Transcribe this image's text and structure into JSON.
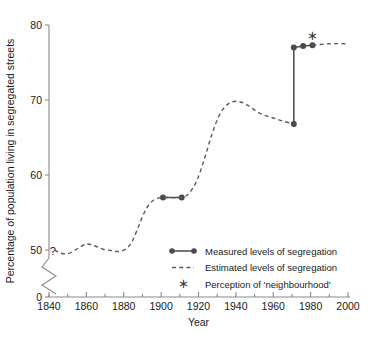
{
  "chart_data": {
    "type": "line",
    "title": "",
    "xlabel": "Year",
    "ylabel": "Percentage of population living in segregated streets",
    "xlim": [
      1840,
      2000
    ],
    "ylim": [
      45,
      80
    ],
    "grid": false,
    "axis_break": true,
    "axis_break_note": "y-axis broken between 0 and 50",
    "legend_position": "inside-lower-right",
    "x_ticks_major": [
      1840,
      1860,
      1880,
      1900,
      1920,
      1940,
      1960,
      1980,
      2000
    ],
    "x_tick_labels": [
      "1840",
      "1860",
      "1880",
      "1900",
      "1920",
      "1940",
      "1960",
      "1980",
      "2000"
    ],
    "x_ticks_minor": [
      1850,
      1870,
      1890,
      1910,
      1930,
      1950,
      1970,
      1990
    ],
    "y_ticks": [
      0,
      50,
      60,
      70,
      80
    ],
    "y_tick_labels": [
      "0",
      "50",
      "60",
      "70",
      "80"
    ],
    "annotations": [
      {
        "text": "?",
        "x": 1842,
        "y": 49.9,
        "note": "uncertainty before 1845"
      },
      {
        "text": "*",
        "x": 1981,
        "y": 78.6,
        "note": "perception of neighbourhood marker"
      }
    ],
    "series": [
      {
        "name": "Measured levels of segregation",
        "style": "solid-with-markers",
        "color": "#4a4a4a",
        "points": [
          {
            "x": 1901,
            "y": 57.0
          },
          {
            "x": 1911,
            "y": 57.0
          }
        ]
      },
      {
        "name": "Measured levels of segregation (late)",
        "style": "solid-with-markers",
        "color": "#4a4a4a",
        "points": [
          {
            "x": 1971,
            "y": 66.8
          },
          {
            "x": 1971,
            "y": 77.0
          },
          {
            "x": 1976,
            "y": 77.2
          },
          {
            "x": 1981,
            "y": 77.3
          }
        ]
      },
      {
        "name": "Estimated levels of segregation",
        "style": "dashed",
        "color": "#5a5a5a",
        "points": [
          {
            "x": 1843,
            "y": 50.0
          },
          {
            "x": 1846,
            "y": 49.6
          },
          {
            "x": 1850,
            "y": 49.5
          },
          {
            "x": 1854,
            "y": 50.0
          },
          {
            "x": 1858,
            "y": 50.6
          },
          {
            "x": 1861,
            "y": 50.8
          },
          {
            "x": 1865,
            "y": 50.5
          },
          {
            "x": 1869,
            "y": 50.1
          },
          {
            "x": 1874,
            "y": 49.9
          },
          {
            "x": 1878,
            "y": 49.8
          },
          {
            "x": 1882,
            "y": 50.3
          },
          {
            "x": 1885,
            "y": 51.4
          },
          {
            "x": 1888,
            "y": 53.2
          },
          {
            "x": 1891,
            "y": 55.0
          },
          {
            "x": 1894,
            "y": 56.2
          },
          {
            "x": 1897,
            "y": 56.8
          },
          {
            "x": 1901,
            "y": 57.0
          },
          {
            "x": 1911,
            "y": 57.0
          },
          {
            "x": 1915,
            "y": 57.6
          },
          {
            "x": 1919,
            "y": 59.2
          },
          {
            "x": 1923,
            "y": 62.0
          },
          {
            "x": 1927,
            "y": 65.3
          },
          {
            "x": 1931,
            "y": 67.9
          },
          {
            "x": 1935,
            "y": 69.3
          },
          {
            "x": 1939,
            "y": 69.8
          },
          {
            "x": 1943,
            "y": 69.7
          },
          {
            "x": 1947,
            "y": 69.2
          },
          {
            "x": 1951,
            "y": 68.5
          },
          {
            "x": 1955,
            "y": 68.0
          },
          {
            "x": 1960,
            "y": 67.6
          },
          {
            "x": 1965,
            "y": 67.2
          },
          {
            "x": 1971,
            "y": 66.8
          }
        ]
      },
      {
        "name": "Estimated levels of segregation (post-1981)",
        "style": "dashed",
        "color": "#5a5a5a",
        "points": [
          {
            "x": 1981,
            "y": 77.3
          },
          {
            "x": 1990,
            "y": 77.5
          },
          {
            "x": 2000,
            "y": 77.5
          }
        ]
      }
    ]
  },
  "legend": {
    "items": [
      {
        "label": "Measured levels of segregation",
        "marker": "line-with-dots"
      },
      {
        "label": "Estimated levels of segregation",
        "marker": "dashed-line"
      },
      {
        "label": "Perception of 'neighbourhood'",
        "marker": "star"
      }
    ]
  },
  "axes": {
    "x_title": "Year",
    "y_title": "Percentage of population living in segregated streets"
  }
}
